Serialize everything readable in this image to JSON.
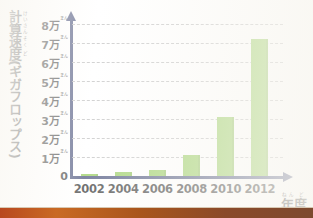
{
  "chart_data": {
    "type": "bar",
    "title": "",
    "subtitle": "",
    "ylabel": "計算速度(ギガフロップス)",
    "ylabel_plain": "計算速度(ギガフロップス)",
    "xlabel": "年度",
    "xlabel_reading": "ねんど",
    "unit_suffix": "万",
    "unit_reading": "まん",
    "categories": [
      "2002",
      "2004",
      "2006",
      "2008",
      "2010",
      "2012"
    ],
    "values": [
      0.1,
      0.2,
      0.3,
      1.1,
      3.1,
      7.2
    ],
    "value_labels": [
      "0.1万",
      "0.2万",
      "0.3万",
      "1.1万",
      "3.1万",
      "7.2万"
    ],
    "ylim": [
      0,
      8
    ],
    "yticks": [
      0,
      1,
      2,
      3,
      4,
      5,
      6,
      7,
      8
    ],
    "ytick_labels": [
      "0",
      "1万",
      "2万",
      "3万",
      "4万",
      "5万",
      "6万",
      "7万",
      "8万"
    ],
    "grid": true,
    "legend": false,
    "legend_position": "none",
    "series": [
      {
        "name": "計算速度",
        "values": [
          0.1,
          0.2,
          0.3,
          1.1,
          3.1,
          7.2
        ]
      }
    ]
  },
  "ylabel_ruby": [
    {
      "base": "計",
      "rt": "けい"
    },
    {
      "base": "算",
      "rt": "さん"
    },
    {
      "base": "速",
      "rt": "そく"
    },
    {
      "base": "度",
      "rt": "ど"
    },
    {
      "base": "(ギガフロップス)",
      "rt": ""
    }
  ],
  "xlabel_ruby": [
    {
      "base": "年",
      "rt": "ねん"
    },
    {
      "base": "度",
      "rt": "ど"
    }
  ],
  "colors": {
    "bar": "#83c341",
    "axis": "#2a3566",
    "grid": "#a9a9a9",
    "text": "#111111",
    "background": "#ffffff",
    "strip": "#b8481f"
  },
  "icons": {
    "y_axis_arrow": "arrow-up-icon",
    "x_axis_arrow": "arrow-right-icon"
  }
}
